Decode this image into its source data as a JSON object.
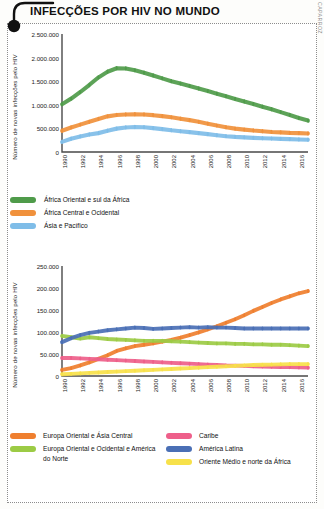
{
  "header": {
    "title": "INFECÇÕES POR HIV NO MUNDO",
    "credit": "SELMA CAPARROZ"
  },
  "colors": {
    "green_dark": "#4f9b4a",
    "orange": "#f0913c",
    "blue_light": "#7fbde8",
    "orange2": "#ef7f2f",
    "green_light": "#9ccb45",
    "pink": "#ee5f8a",
    "blue_dark": "#4a6fb5",
    "yellow": "#f7e14a",
    "axis": "#4a4a4a",
    "frame": "#8c8c8c"
  },
  "chart_data": [
    {
      "type": "line",
      "id": "chart1",
      "title": "",
      "xlabel": "",
      "ylabel": "Número de novas infecções pelo HIV",
      "x": [
        1990,
        1991,
        1992,
        1993,
        1994,
        1995,
        1996,
        1997,
        1998,
        1999,
        2000,
        2001,
        2002,
        2003,
        2004,
        2005,
        2006,
        2007,
        2008,
        2009,
        2010,
        2011,
        2012,
        2013,
        2014,
        2015,
        2016,
        2017
      ],
      "xticks": [
        "1990",
        "1992",
        "1994",
        "1996",
        "1998",
        "2000",
        "2002",
        "2004",
        "2006",
        "2008",
        "2010",
        "2012",
        "2014",
        "2016"
      ],
      "yticks": [
        "0",
        "500.000",
        "1.000.000",
        "1.500.000",
        "2.000.000",
        "2.500.000"
      ],
      "ylim": [
        0,
        2500000
      ],
      "grid": false,
      "legend_position": "bottom",
      "series": [
        {
          "name": "África Oriental e sul da África",
          "color": "#4f9b4a",
          "values": [
            1010000,
            1130000,
            1270000,
            1420000,
            1580000,
            1700000,
            1775000,
            1770000,
            1730000,
            1680000,
            1620000,
            1560000,
            1500000,
            1450000,
            1400000,
            1345000,
            1290000,
            1235000,
            1180000,
            1125000,
            1070000,
            1015000,
            960000,
            905000,
            845000,
            785000,
            720000,
            665000
          ]
        },
        {
          "name": "África Central e Ocidental",
          "color": "#f0913c",
          "values": [
            450000,
            520000,
            580000,
            640000,
            700000,
            755000,
            785000,
            795000,
            800000,
            795000,
            780000,
            760000,
            735000,
            705000,
            675000,
            640000,
            600000,
            560000,
            525000,
            495000,
            475000,
            455000,
            440000,
            425000,
            415000,
            405000,
            400000,
            392000
          ]
        },
        {
          "name": "Ásia e Pacífico",
          "color": "#7fbde8",
          "values": [
            215000,
            280000,
            330000,
            370000,
            400000,
            450000,
            495000,
            520000,
            530000,
            525000,
            505000,
            485000,
            460000,
            440000,
            420000,
            400000,
            378000,
            355000,
            335000,
            320000,
            310000,
            300000,
            292000,
            285000,
            278000,
            272000,
            265000,
            260000
          ]
        }
      ]
    },
    {
      "type": "line",
      "id": "chart2",
      "title": "",
      "xlabel": "",
      "ylabel": "Número de novas infecções pelo HIV",
      "x": [
        1990,
        1991,
        1992,
        1993,
        1994,
        1995,
        1996,
        1997,
        1998,
        1999,
        2000,
        2001,
        2002,
        2003,
        2004,
        2005,
        2006,
        2007,
        2008,
        2009,
        2010,
        2011,
        2012,
        2013,
        2014,
        2015,
        2016,
        2017
      ],
      "xticks": [
        "1990",
        "1992",
        "1994",
        "1996",
        "1998",
        "2000",
        "2002",
        "2004",
        "2006",
        "2008",
        "2010",
        "2012",
        "2014",
        "2016"
      ],
      "yticks": [
        "0",
        "50.000",
        "100.000",
        "150.000",
        "200.000",
        "250.000"
      ],
      "ylim": [
        0,
        250000
      ],
      "grid": false,
      "legend_position": "bottom",
      "series": [
        {
          "name": "Europa Oriental e Ásia Central",
          "color": "#ef7f2f",
          "values": [
            14000,
            18000,
            24000,
            31000,
            39000,
            47000,
            57000,
            63000,
            68000,
            71000,
            74000,
            78000,
            82000,
            87000,
            93000,
            99000,
            106000,
            113000,
            121000,
            129000,
            138000,
            148000,
            157000,
            166000,
            174000,
            181000,
            188000,
            193000
          ]
        },
        {
          "name": "Europa Oriental e Ocidental e América do Norte",
          "color": "#9ccb45",
          "values": [
            91000,
            88000,
            85000,
            88000,
            86000,
            84000,
            83000,
            82000,
            81000,
            80000,
            80000,
            80000,
            79000,
            78000,
            77000,
            76000,
            75000,
            74000,
            74000,
            73000,
            73000,
            72000,
            72000,
            71000,
            71000,
            70000,
            69000,
            68000
          ]
        },
        {
          "name": "Caribe",
          "color": "#ee5f8a",
          "values": [
            41000,
            41000,
            40000,
            39000,
            38000,
            37000,
            36000,
            35000,
            34000,
            33000,
            32000,
            31000,
            30000,
            29000,
            28000,
            27000,
            26000,
            25000,
            24000,
            23500,
            23000,
            22000,
            21500,
            21000,
            20500,
            20000,
            19500,
            19000
          ]
        },
        {
          "name": "América Latina",
          "color": "#4a6fb5",
          "values": [
            77000,
            86000,
            93000,
            98000,
            101000,
            104000,
            106000,
            108000,
            110000,
            109000,
            107000,
            108000,
            109000,
            110000,
            111000,
            110000,
            111000,
            110000,
            110000,
            109000,
            108000,
            108000,
            108000,
            108000,
            108000,
            108000,
            108000,
            108000
          ]
        },
        {
          "name": "Oriente Médio e norte da África",
          "color": "#f7e14a",
          "values": [
            4000,
            5000,
            6000,
            7000,
            8000,
            9000,
            10000,
            11000,
            12000,
            13000,
            14000,
            15000,
            16000,
            17000,
            18000,
            19000,
            20000,
            21000,
            22000,
            23000,
            24000,
            25000,
            25500,
            26000,
            26500,
            27000,
            27000,
            27000
          ]
        }
      ]
    }
  ]
}
